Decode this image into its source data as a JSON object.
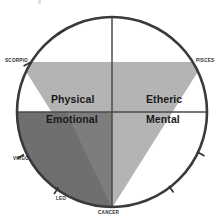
{
  "diagram": {
    "type": "four-quadrant-zodiac-wheel",
    "background_color": "#ffffff",
    "circle": {
      "center_x": 112,
      "center_y": 112,
      "radius": 96,
      "stroke_color": "#3a3a3a",
      "stroke_width": 2.4,
      "fill": "#ffffff"
    },
    "axes": {
      "stroke_color": "#4a4a4a",
      "stroke_width": 1.4,
      "horizontal": true,
      "vertical": true
    },
    "shapes": {
      "light_triangle": {
        "name": "major-downward-triangle",
        "fill": "#b4b4b4",
        "vertices_label": [
          "SCORPIO",
          "PISCES",
          "CANCER"
        ]
      },
      "dark_region": {
        "name": "emotional-quadrant-overlay",
        "fill": "#6f6f6f"
      },
      "mid_region": {
        "name": "emotional-triangle-sliver",
        "fill": "#808080"
      }
    },
    "quadrants": [
      {
        "id": "physical",
        "label": "Physical",
        "position": "upper-left"
      },
      {
        "id": "etheric",
        "label": "Etheric",
        "position": "upper-right"
      },
      {
        "id": "emotional",
        "label": "Emotional",
        "position": "lower-left"
      },
      {
        "id": "mental",
        "label": "Mental",
        "position": "lower-right"
      }
    ],
    "zodiac_labels": [
      {
        "id": "scorpio",
        "label": "SCORPIO",
        "position": "left-upper"
      },
      {
        "id": "pisces",
        "label": "PISCES",
        "position": "right-upper"
      },
      {
        "id": "virgo",
        "label": "VIRGO",
        "position": "left-lower"
      },
      {
        "id": "leo",
        "label": "LEO",
        "position": "bottom-left"
      },
      {
        "id": "cancer",
        "label": "CANCER",
        "position": "bottom"
      }
    ],
    "tick_marks": {
      "count": 6,
      "stroke_color": "#2f2f2f",
      "angles_deg": [
        120,
        150,
        180,
        210,
        330,
        300
      ]
    }
  }
}
